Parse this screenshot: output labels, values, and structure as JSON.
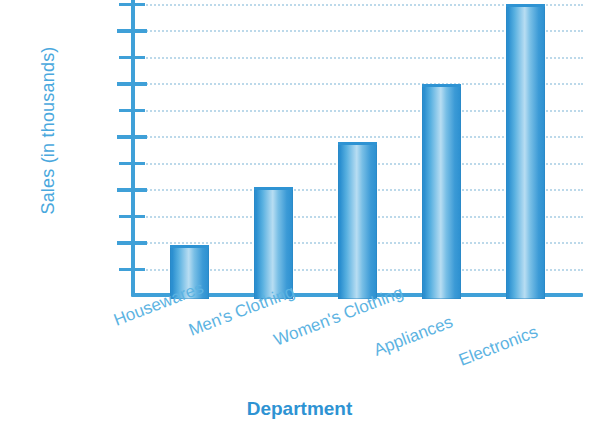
{
  "chart_data": {
    "type": "bar",
    "title": "",
    "xlabel": "Department",
    "ylabel": "Sales (in thousands)",
    "categories": [
      "Housewares",
      "Men's Clothing",
      "Women's Clothing",
      "Appliances",
      "Electronics"
    ],
    "values": [
      121,
      143,
      160,
      182,
      212
    ],
    "ylim": [
      110,
      211
    ],
    "y_tick_major": [
      120,
      140,
      160,
      180,
      200
    ],
    "y_tick_minor": [
      110,
      130,
      150,
      170,
      190,
      210
    ],
    "y_tick_labels": [
      "120",
      "140",
      "160",
      "180",
      "200"
    ],
    "grid": true,
    "grid_style": "dotted",
    "legend": "none",
    "colors": {
      "bar_fill_dark": "#2b8fd0",
      "bar_fill_light": "#b8ddf2",
      "axis": "#3fa0d8",
      "tick_label": "#4aa8dd",
      "category_label": "#5cb3e2",
      "axis_title": "#2e93d3",
      "gridline": "#bcd9ea",
      "background": "#ffffff"
    }
  }
}
